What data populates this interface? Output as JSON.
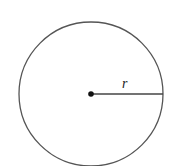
{
  "diagram": {
    "title": "",
    "shape": "circle",
    "radius_label": "r",
    "colors": {
      "stroke": "#555555",
      "center_dot": "#111111",
      "background": "#ffffff"
    },
    "geometry": {
      "center": [
        91,
        94
      ],
      "radius": 72
    }
  }
}
